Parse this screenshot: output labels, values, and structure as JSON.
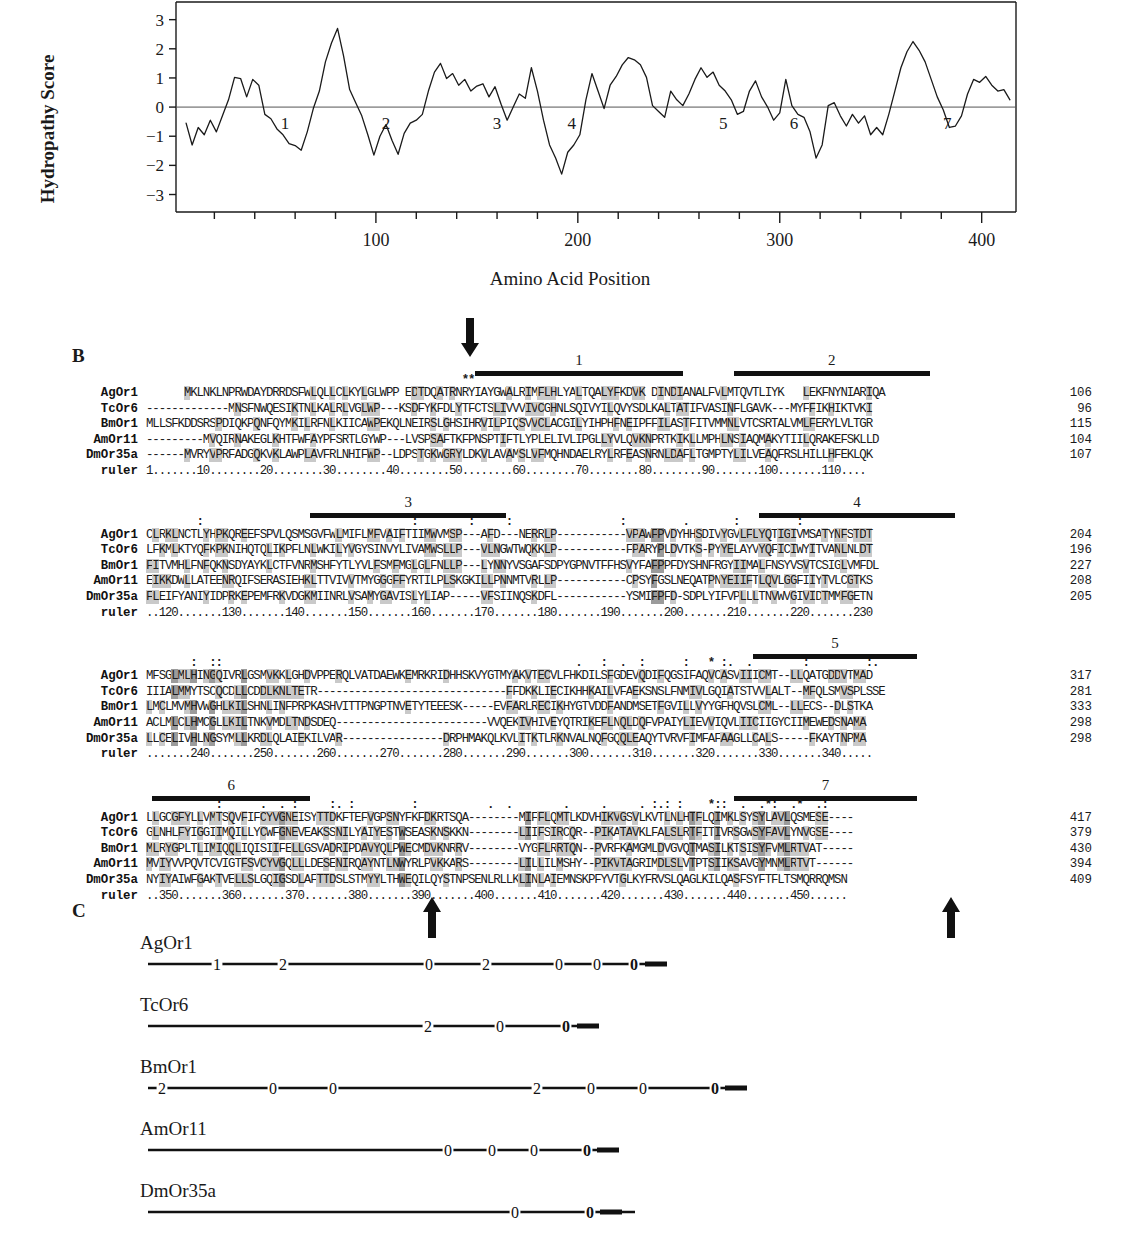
{
  "panels": {
    "a_letter": "",
    "b_letter": "B",
    "c_letter": "C"
  },
  "chart_data": {
    "type": "line",
    "title": "",
    "xlabel": "Amino Acid Position",
    "ylabel": "Hydropathy Score",
    "xlim": [
      1,
      417
    ],
    "ylim": [
      -3.6,
      3.4
    ],
    "yticks": [
      3,
      2,
      1,
      0,
      -1,
      -2,
      -3
    ],
    "ytick_labels": [
      "3",
      "2",
      "1",
      "0",
      "−1",
      "−2",
      "−3"
    ],
    "xticks": [
      100,
      200,
      300,
      400
    ],
    "xtick_labels": [
      "100",
      "200",
      "300",
      "400"
    ],
    "minor_tick_interval": 20,
    "zero_line": true,
    "grid": false,
    "annotations": [
      {
        "label": "1",
        "x": 55
      },
      {
        "label": "2",
        "x": 105
      },
      {
        "label": "3",
        "x": 160
      },
      {
        "label": "4",
        "x": 197
      },
      {
        "label": "5",
        "x": 272
      },
      {
        "label": "6",
        "x": 307
      },
      {
        "label": "7",
        "x": 383
      }
    ],
    "x": [
      6,
      9,
      12,
      15,
      18,
      21,
      24,
      27,
      30,
      33,
      36,
      39,
      42,
      45,
      48,
      51,
      54,
      57,
      60,
      63,
      66,
      69,
      72,
      75,
      78,
      81,
      84,
      87,
      90,
      93,
      96,
      99,
      102,
      105,
      108,
      111,
      114,
      117,
      120,
      123,
      126,
      129,
      132,
      135,
      138,
      141,
      144,
      147,
      150,
      153,
      156,
      159,
      162,
      165,
      168,
      171,
      174,
      177,
      180,
      183,
      186,
      189,
      192,
      195,
      198,
      201,
      204,
      207,
      210,
      213,
      216,
      219,
      222,
      225,
      228,
      231,
      234,
      237,
      240,
      243,
      246,
      249,
      252,
      255,
      258,
      261,
      264,
      267,
      270,
      273,
      276,
      279,
      282,
      285,
      288,
      291,
      294,
      297,
      300,
      303,
      306,
      309,
      312,
      315,
      318,
      321,
      324,
      327,
      330,
      333,
      336,
      339,
      342,
      345,
      348,
      351,
      354,
      357,
      360,
      363,
      366,
      369,
      372,
      375,
      378,
      381,
      384,
      387,
      390,
      393,
      396,
      399,
      402,
      405,
      408,
      411,
      414
    ],
    "y": [
      -0.55,
      -1.3,
      -0.7,
      -0.95,
      -0.45,
      -0.85,
      -0.3,
      0.25,
      1.02,
      0.98,
      0.35,
      0.95,
      0.75,
      -0.25,
      -0.4,
      -0.75,
      -0.95,
      -1.25,
      -1.32,
      -1.48,
      -0.85,
      -0.05,
      0.55,
      1.55,
      2.2,
      2.7,
      1.75,
      0.6,
      0.15,
      -0.3,
      -0.95,
      -1.65,
      -1.0,
      -0.6,
      -1.15,
      -1.62,
      -0.9,
      -0.55,
      -0.45,
      -0.25,
      0.55,
      1.2,
      1.5,
      0.98,
      1.15,
      0.75,
      0.95,
      0.55,
      0.72,
      0.8,
      0.35,
      0.7,
      0.1,
      -0.45,
      0.0,
      0.45,
      0.3,
      1.35,
      0.55,
      -0.45,
      -1.3,
      -1.75,
      -2.3,
      -1.55,
      -1.3,
      -0.95,
      0.25,
      1.15,
      0.55,
      -0.05,
      0.75,
      1.05,
      1.45,
      1.7,
      1.62,
      1.45,
      1.02,
      0.05,
      -0.15,
      -0.35,
      0.55,
      0.25,
      0.05,
      0.45,
      0.95,
      1.35,
      1.02,
      1.2,
      0.75,
      0.55,
      0.25,
      -0.25,
      -0.15,
      0.55,
      0.9,
      0.35,
      0.0,
      -0.45,
      -0.2,
      0.95,
      0.05,
      -0.25,
      -0.35,
      -0.85,
      -1.75,
      -1.3,
      0.05,
      0.15,
      -0.3,
      -0.65,
      -0.25,
      -0.55,
      -0.3,
      -0.95,
      -0.7,
      -0.95,
      -0.25,
      0.55,
      1.35,
      1.9,
      2.25,
      1.95,
      1.55,
      0.95,
      0.35,
      -0.1,
      -0.7,
      -0.65,
      -0.3,
      0.45,
      0.95,
      0.85,
      1.05,
      0.75,
      0.55,
      0.6,
      0.25,
      -0.05,
      -0.45,
      -0.8,
      -0.35,
      0.1,
      -0.25,
      -0.65,
      -0.35,
      0.15,
      -0.1,
      0.55,
      0.35,
      0.85,
      0.55,
      0.9,
      0.6,
      0.35,
      -0.25,
      -0.85,
      -1.25,
      -1.45,
      -1.15,
      -0.85,
      -1.15,
      -1.6,
      -0.95,
      -0.25,
      0.85,
      1.35,
      0.95,
      0.25,
      -0.35,
      -0.75,
      -0.35,
      0.05,
      0.55,
      0.35,
      0.85,
      0.75,
      0.95,
      0.7,
      0.85,
      0.55,
      0.25,
      -0.45,
      -1.05,
      -1.35
    ]
  },
  "alignment": {
    "names": [
      "AgOr1",
      "TcOr6",
      "BmOr1",
      "AmOr11",
      "DmOr35a"
    ],
    "ruler_name": "ruler",
    "blocks": [
      {
        "tm_bars": [
          {
            "label": "1",
            "start_col": 52,
            "len": 33
          },
          {
            "label": "2",
            "start_col": 93,
            "len": 31
          }
        ],
        "sym_rows": [
          {
            "offset_top": -11,
            "text": "                                                  **"
          }
        ],
        "arrows_down": [
          {
            "col": 51
          }
        ],
        "arrows_up": [],
        "seqs": [
          "      MKLNKLNPRWDAYDRRDSFWLQLLCLKYLGLWPP EDTDQATRNRYIAYGWALRIMFLHLYALTQALYFKDVK DINDIANALFVLMTQVTLIYK   LEKFNYNIARIQA",
          "-------------MNSFNWQESIKTNLKALRLVGLWP---KSDFYKFDLYTFCTSLIVVVIVCGHNLSQIVYILQVYSDLKALTATIFVASINFLGAVK---MYFFIKHIKTVKI",
          "MLLSFKDDSRSPDIQKPQNFQYMKILRFNLKIICAWPEKQLNEIRSLGHSIHRVILPIQSVVCLACGILYIHPHFNEIPFFILASTFITVMMNLVTCSRTALVMLFERYLVLTGR",
          "---------MVQIRNAKEGLKHTFWFAYPFSRTLGYWP---LVSPSAFTKFPNSPTIFTLYPLELIVLIPGLLYVLQVKNPRTKIKLLMPHLNSIAQMAKYTIILQRAKEFSKLLD",
          "------MVRYVPRFADGQKVKLAWPLAVFRLNHIFWP--LDPSTGKWGRYLDKVLAVAMSLVFMQHNDAELRYLRFEASNRNLDAFLTGMPTYLILVEAQFRSLHILLHFEKLQK"
        ],
        "nums": [
          "106",
          "96",
          "115",
          "104",
          "107"
        ],
        "ruler": "1.......10........20........30........40........50........60........70........80........90.......100.......110...."
      },
      {
        "tm_bars": [
          {
            "label": "3",
            "start_col": 26,
            "len": 31
          },
          {
            "label": "4",
            "start_col": 97,
            "len": 31
          }
        ],
        "sym_rows": [
          {
            "offset_top": -11,
            "text": "        :                                 :        :     :                 :         .       :         :"
          }
        ],
        "arrows_down": [],
        "arrows_up": [],
        "seqs": [
          "CLRKLNCTLYHPKQREEFSPVLQSMSGVFWLMIFLMFVAIFTIIMWVMSP---AFD---NERRLP-----------VPAWFPVDYHHSDIVYGVLFLYQTIGIVMSATYNFSTDT",
          "LFKMLKTYQFKPKNIHQTQLIKPFLNLWKILYVGYSINVYLIVAMWSLLP---VLNGWTWQKKLP-----------FPARYPLDVTKS-PYYELAYVYQFICIWYITVANLNLDT",
          "FITVMHLFNFQKNSDYAYKLCTFVNRMSHFYTLYVLFSMFMGLGLFNLLP---LYNNYVSGAFSDPYGPNVTFFHSVYFAFPPFDYSHNFRGYIIMALFNSYVSVTCSIGLVMFDL",
          "EIKKDWLLATEENRQIFSERASIEHKLTTVIVVTMYGGGFFYRTILPLSKGKILLPNNMTVRLLP-----------CPSYFGSLNEQATPNYEIIFTLQVLGGFIIYTVLCGTKS",
          "FLEIFYANIYIDPRKEPEMFRKVDGKMIINRLVSAMYGAVISLYLIAP-----VFSIINQSKDFL-----------YSMIFPFD-SDPLYIFVPLLLTNVWVGIVIDTMMFGETN"
        ],
        "nums": [
          "204",
          "196",
          "227",
          "208",
          "205"
        ],
        "ruler": "..120.......130.......140.......150.......160.......170.......180.......190.......200.......210.......220.......230"
      },
      {
        "tm_bars": [
          {
            "label": "5",
            "start_col": 96,
            "len": 26
          }
        ],
        "sym_rows": [
          {
            "offset_top": -11,
            "text": "       :  ::                                                        .   :  .  :      :   * :.  .        :         :."
          }
        ],
        "arrows_down": [],
        "arrows_up": [],
        "seqs": [
          "MFSGLMLHINGQIVRLGSMVKKLGHDVPPERQLVATDAEWKEMRKRIDHHSKVYGTMYAKVTECVLFHKDILSFGDEVQDIFQGSIFAQVCASVIIICMT--LLQATGDDVTMAD",
          "IIIALMMYTSCQCDLLCDDLKNLTETR------------------------------FFDKKLIECIKHHKAILVFAEKSNSLFNMIVLGQIATSTVVLALT--MFQLSMVSPLSSE",
          "LMCLMVMHVWGHLKILSHNLINFPRPKASHVITTPNGPTNVETYTEEESK-----EVFARLRECIKHYGTVDDFANDMSETFGVILLVYYGFHQVSLCML--LLECS--DLSTKA",
          "ACLMLCLHMCGLLKILTNKVMDLTNDSDEQ------------------------VVQEKIVHIVEYQTRIKEFLNQLDQFVPAIYLIEVVIQVLIICIIGYCIIMEWEDSNAMA",
          "LLCELIVHLNGSYMLLKRDLQLAIEKILVAR----------------DRPHMAKQLKVLITKTLRKNVALNQFGQQLEAQYTVRVFIMFAFAAGLLCALS-----FKAYTNPMA"
        ],
        "nums": [
          "317",
          "281",
          "333",
          "298",
          "298"
        ],
        "ruler": ".......240.......250.......260.......270.......280.......290.......300.......310.......320.......330.......340....."
      },
      {
        "tm_bars": [
          {
            "label": "6",
            "start_col": 1,
            "len": 25
          },
          {
            "label": "7",
            "start_col": 93,
            "len": 29
          }
        ],
        "sym_rows": [
          {
            "offset_top": -11,
            "text": "           :      .  . :     :. :         :           .  .        .     .     . :.: :    *::  .  .*:  .*  .:"
          }
        ],
        "arrows_down": [],
        "arrows_up": [
          {
            "col": 45
          },
          {
            "col": 127
          }
        ],
        "seqs": [
          "LLGCGFYLLVMTSQVFIFCYVGNEISYTTDKFTEFVGPSNYFKFDKRTSQA--------MIFFLQMTLKDVHIKVGSVLKVTLNLHTFLQIMKLSYSYLAVLQSMESE----",
          "GLNHLFYIGGIIMQILLYCWFGNEVEAKSSNILYAIYESTWSEASKNSKKN--------LIIFSIRCQR--PIKATAVKLFALSLRTFITIVRSGWSYFAVLYNVGSE----",
          "MLRYGPLTLIMIQQLIQISIIFELLGSVADRIPDAVYQLPWECMDVKNRRV--------VYGFLRRTQN--PVRFKAMGMLDVGVQTMASILKTSISYFVMLRTVAT-----",
          "MVIYVVPQVTCVIGTFSVCYVGQLLLDESENIRQAYNTLNWYRLPVKKARS--------LILLILMSHY--PIKVTAGRIMDLSLVTPTSIIKSAVGYMNMLRTVT------",
          "NYIYAIWFGAKTVELLSLGQIGSDLAFTTDSLSTMYYLTHWEQILQYSTNPSENLRLLKLINLAIEMNSKPFYVTGLKYFRVSLQAGLKILQASFSYFTFLTSMQRRQMSN"
        ],
        "nums": [
          "417",
          "379",
          "430",
          "394",
          "409"
        ],
        "ruler": "..350.......360.......370.......380.......390.......400.......410.......420.......430.......440.......450......"
      }
    ]
  },
  "gene_structures": {
    "rows": [
      {
        "name": "AgOr1",
        "line_start": 8,
        "line_end": 520,
        "introns": [
          {
            "phase": "1",
            "x": 77
          },
          {
            "phase": "2",
            "x": 143
          },
          {
            "phase": "0",
            "x": 289
          },
          {
            "phase": "2",
            "x": 346
          },
          {
            "phase": "0",
            "x": 419
          },
          {
            "phase": "0",
            "x": 457
          },
          {
            "phase": "0",
            "x": 494,
            "bold": true
          }
        ],
        "tail_x": 505,
        "tail_w": 22
      },
      {
        "name": "TcOr6",
        "line_start": 8,
        "line_end": 450,
        "introns": [
          {
            "phase": "2",
            "x": 288
          },
          {
            "phase": "0",
            "x": 360
          },
          {
            "phase": "0",
            "x": 426,
            "bold": true
          }
        ],
        "tail_x": 437,
        "tail_w": 22
      },
      {
        "name": "BmOr1",
        "line_start": 8,
        "line_end": 595,
        "introns": [
          {
            "phase": "2",
            "x": 22
          },
          {
            "phase": "0",
            "x": 133
          },
          {
            "phase": "0",
            "x": 193
          },
          {
            "phase": "2",
            "x": 397
          },
          {
            "phase": "0",
            "x": 451
          },
          {
            "phase": "0",
            "x": 503
          },
          {
            "phase": "0",
            "x": 575,
            "bold": true
          }
        ],
        "tail_x": 585,
        "tail_w": 22
      },
      {
        "name": "AmOr11",
        "line_start": 8,
        "line_end": 470,
        "introns": [
          {
            "phase": "0",
            "x": 308
          },
          {
            "phase": "0",
            "x": 352
          },
          {
            "phase": "0",
            "x": 394
          },
          {
            "phase": "0",
            "x": 447,
            "bold": true
          }
        ],
        "tail_x": 457,
        "tail_w": 22
      },
      {
        "name": "DmOr35a",
        "line_start": 8,
        "line_end": 495,
        "introns": [
          {
            "phase": "0",
            "x": 375
          },
          {
            "phase": "0",
            "x": 450,
            "bold": true
          }
        ],
        "tail_x": 460,
        "tail_w": 22
      }
    ]
  }
}
